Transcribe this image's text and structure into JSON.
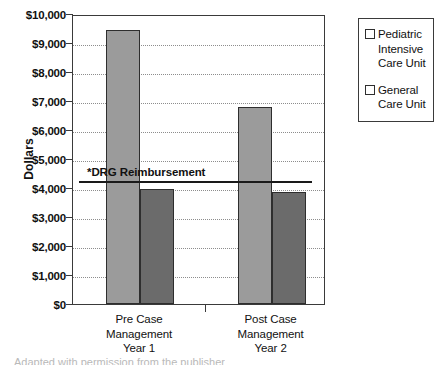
{
  "chart_data": {
    "type": "bar",
    "title": "",
    "xlabel": "",
    "ylabel": "Dollars",
    "ylim": [
      0,
      10000
    ],
    "ytick_labels": [
      "$10,000",
      "$9,000",
      "$8,000",
      "$7,000",
      "$6,000",
      "$5,000",
      "$4,000",
      "$3,000",
      "$2,000",
      "$1,000",
      "$0"
    ],
    "ytick_values": [
      10000,
      9000,
      8000,
      7000,
      6000,
      5000,
      4000,
      3000,
      2000,
      1000,
      0
    ],
    "grid": true,
    "legend_position": "right-outside",
    "categories": [
      "Pre Case Management Year 1",
      "Post Case Management Year 2"
    ],
    "category_lines": [
      [
        "Pre Case",
        "Management",
        "Year 1"
      ],
      [
        "Post Case",
        "Management",
        "Year 2"
      ]
    ],
    "series": [
      {
        "name": "Pediatric Intensive Care Unit",
        "name_lines": [
          "Pediatric",
          "Intensive",
          "Care Unit"
        ],
        "color": "#9b9b9b",
        "values": [
          9450,
          6800
        ]
      },
      {
        "name": "General Care Unit",
        "name_lines": [
          "General",
          "Care Unit"
        ],
        "color": "#6b6b6b",
        "values": [
          3950,
          3850
        ]
      }
    ],
    "annotations": [
      {
        "type": "reference-line",
        "label": "*DRG Reimbursement",
        "value": 4300,
        "color": "#1a1a1a"
      }
    ]
  },
  "footnote": {
    "text": "Adapted with permission from the publisher"
  }
}
